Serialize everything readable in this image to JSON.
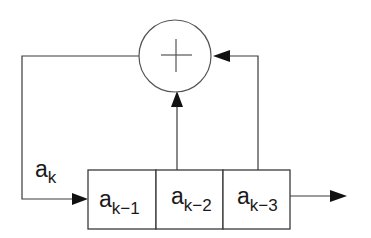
{
  "diagram": {
    "type": "linear-feedback-shift-register",
    "adder": {
      "symbol": "+",
      "label": "modulo-2 adder"
    },
    "input_label": {
      "base": "a",
      "sub": "k"
    },
    "registers": [
      {
        "base": "a",
        "sub": "k−1"
      },
      {
        "base": "a",
        "sub": "k−2"
      },
      {
        "base": "a",
        "sub": "k−3"
      }
    ],
    "taps": [
      "a_{k-2}",
      "a_{k-3}"
    ],
    "output": "a_{k-3}",
    "colors": {
      "line": "#3a3a3a",
      "arrow": "#111111",
      "background": "#ffffff"
    }
  }
}
